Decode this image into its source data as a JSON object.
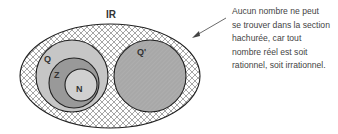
{
  "diagram": {
    "sets": {
      "reals": {
        "label": "IR",
        "fill": "hatched"
      },
      "rationals": {
        "label": "Q",
        "fill": "#c8c8c8"
      },
      "integers": {
        "label": "Z",
        "fill": "#9a9a9a"
      },
      "naturals": {
        "label": "N",
        "fill": "#cfcfcf"
      },
      "irrationals": {
        "label": "Q'",
        "fill": "#a9a9a9"
      }
    },
    "colors": {
      "stroke": "#222222",
      "hatch": "#555555",
      "text": "#444444"
    },
    "annotation": {
      "lines": [
        "Aucun nombre ne peut",
        "se trouver dans la section",
        "hachurée, car tout",
        "nombre réel est soit",
        "rationnel, soit irrationnel."
      ]
    }
  }
}
